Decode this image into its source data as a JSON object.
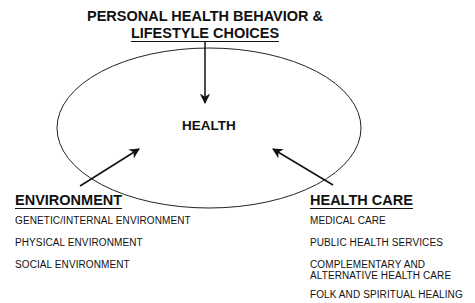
{
  "title": {
    "line1": "PERSONAL HEALTH BEHAVIOR &",
    "line2": "LIFESTYLE CHOICES"
  },
  "center": {
    "label": "HEALTH"
  },
  "environment": {
    "heading": "ENVIRONMENT",
    "items": [
      "GENETIC/INTERNAL ENVIRONMENT",
      "PHYSICAL ENVIRONMENT",
      "SOCIAL ENVIRONMENT"
    ]
  },
  "health_care": {
    "heading": "HEALTH CARE",
    "items": [
      "MEDICAL CARE",
      "PUBLIC HEALTH SERVICES",
      "COMPLEMENTARY AND ALTERNATIVE HEALTH CARE",
      "FOLK AND SPIRITUAL HEALING"
    ]
  },
  "colors": {
    "line": "#111111",
    "background": "#ffffff"
  }
}
